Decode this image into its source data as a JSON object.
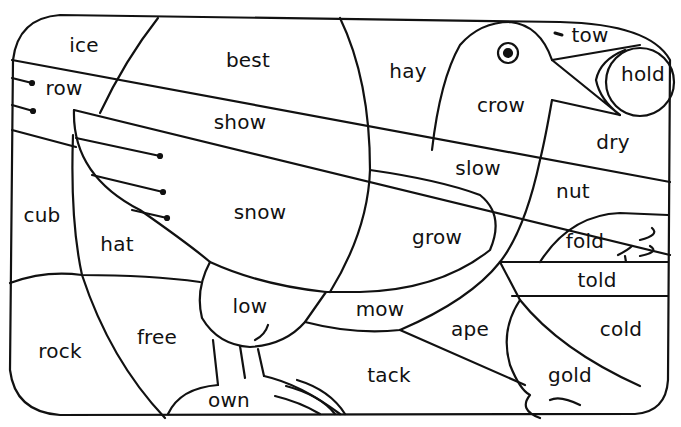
{
  "colors": {
    "ink": "#111111",
    "background": "#ffffff"
  },
  "regions": [
    {
      "id": "ice",
      "label": "ice",
      "x": 84,
      "y": 45
    },
    {
      "id": "best",
      "label": "best",
      "x": 248,
      "y": 60
    },
    {
      "id": "hay",
      "label": "hay",
      "x": 408,
      "y": 71
    },
    {
      "id": "tow",
      "label": "tow",
      "x": 590,
      "y": 35
    },
    {
      "id": "hold",
      "label": "hold",
      "x": 643,
      "y": 74
    },
    {
      "id": "row",
      "label": "row",
      "x": 64,
      "y": 88
    },
    {
      "id": "crow",
      "label": "crow",
      "x": 501,
      "y": 105
    },
    {
      "id": "show",
      "label": "show",
      "x": 240,
      "y": 122
    },
    {
      "id": "dry",
      "label": "dry",
      "x": 613,
      "y": 142
    },
    {
      "id": "slow",
      "label": "slow",
      "x": 478,
      "y": 168
    },
    {
      "id": "nut",
      "label": "nut",
      "x": 573,
      "y": 191
    },
    {
      "id": "cub",
      "label": "cub",
      "x": 42,
      "y": 215
    },
    {
      "id": "snow",
      "label": "snow",
      "x": 260,
      "y": 212
    },
    {
      "id": "grow",
      "label": "grow",
      "x": 437,
      "y": 237
    },
    {
      "id": "fold",
      "label": "fold",
      "x": 585,
      "y": 241
    },
    {
      "id": "hat",
      "label": "hat",
      "x": 117,
      "y": 244
    },
    {
      "id": "told",
      "label": "told",
      "x": 597,
      "y": 280
    },
    {
      "id": "low",
      "label": "low",
      "x": 250,
      "y": 306
    },
    {
      "id": "mow",
      "label": "mow",
      "x": 380,
      "y": 309
    },
    {
      "id": "free",
      "label": "free",
      "x": 157,
      "y": 337
    },
    {
      "id": "ape",
      "label": "ape",
      "x": 470,
      "y": 329
    },
    {
      "id": "cold",
      "label": "cold",
      "x": 621,
      "y": 329
    },
    {
      "id": "rock",
      "label": "rock",
      "x": 60,
      "y": 351
    },
    {
      "id": "tack",
      "label": "tack",
      "x": 389,
      "y": 375
    },
    {
      "id": "gold",
      "label": "gold",
      "x": 570,
      "y": 375
    },
    {
      "id": "own",
      "label": "own",
      "x": 229,
      "y": 400
    }
  ],
  "icons": {
    "bird_eye": "eye-icon",
    "drawing": "bird-outline"
  }
}
